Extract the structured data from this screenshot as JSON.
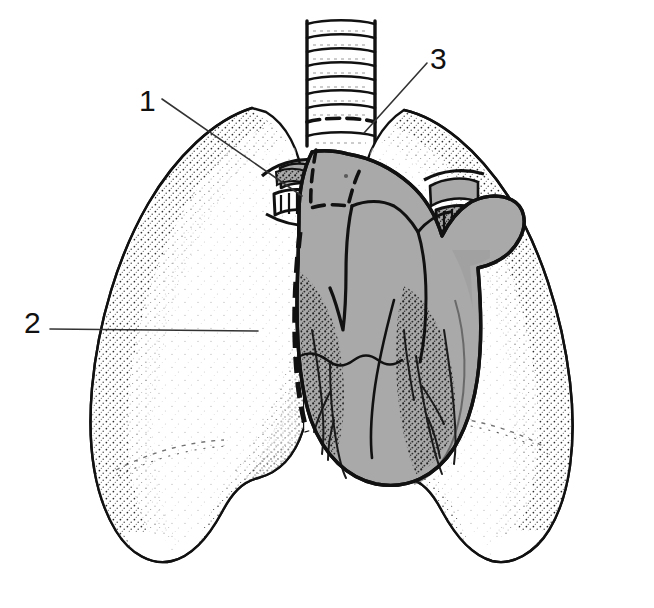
{
  "figure": {
    "kind": "anatomical-line-drawing",
    "background_color": "#ffffff",
    "ink_color": "#111111",
    "heart_fill_color": "#a9a9a9",
    "heart_shadow_color": "#8e8e8e",
    "lung_fill_color": "#ffffff",
    "stipple_color": "#1a1a1a"
  },
  "callouts": [
    {
      "id": "callout-1",
      "label": "1",
      "label_x": 139,
      "label_y": 86,
      "leader": {
        "x1": 162,
        "y1": 99,
        "x2": 302,
        "y2": 196
      },
      "points_to": "left-hilum-bronchus"
    },
    {
      "id": "callout-2",
      "label": "2",
      "label_x": 24,
      "label_y": 308,
      "leader": {
        "x1": 50,
        "y1": 329,
        "x2": 258,
        "y2": 331
      },
      "points_to": "heart-left-border"
    },
    {
      "id": "callout-3",
      "label": "3",
      "label_x": 430,
      "label_y": 44,
      "leader": {
        "x1": 427,
        "y1": 63,
        "x2": 364,
        "y2": 133
      },
      "points_to": "trachea"
    }
  ],
  "structures": [
    {
      "name": "trachea",
      "description": "Vertical airway with stacked cartilage rings at the top centre"
    },
    {
      "name": "left-lung",
      "description": "Large white lobed lung on the image left with stippled margins"
    },
    {
      "name": "right-lung",
      "description": "Large white lobed lung on the image right with stippled margins"
    },
    {
      "name": "heart",
      "description": "Central grey shaded heart with great vessels and coronary vessels"
    },
    {
      "name": "hilum-vessels",
      "description": "Dark branching pulmonary vessels entering each lung root"
    }
  ],
  "trachea": {
    "ring_count": 9,
    "x_left": 306,
    "x_right": 376,
    "y_top": 20,
    "y_bottom": 146
  }
}
